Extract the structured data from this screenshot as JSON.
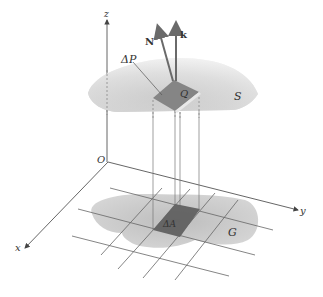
{
  "diagram": {
    "type": "surface-integral-projection",
    "labels": {
      "z_axis": "z",
      "y_axis": "y",
      "x_axis": "x",
      "origin": "O",
      "surface": "S",
      "surface_patch": "ΔP",
      "point": "Q",
      "normal_vector": "N",
      "unit_vector": "k",
      "region": "G",
      "region_patch": "ΔA"
    },
    "colors": {
      "axis": "#555555",
      "surface_light": "#f2f2f2",
      "surface_dark": "#c4c4c4",
      "patch": "#8a8a8a",
      "region": "#c8c8c8",
      "region_patch": "#5a5a5a",
      "vector": "#707070",
      "grid": "#666666"
    }
  }
}
